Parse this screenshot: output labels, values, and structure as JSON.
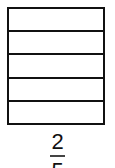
{
  "diagram": {
    "type": "fraction-bar-model",
    "orientation": "horizontal-stripes",
    "total_parts": 5,
    "sections": [
      {
        "index": 0,
        "shaded": false
      },
      {
        "index": 1,
        "shaded": false
      },
      {
        "index": 2,
        "shaded": false
      },
      {
        "index": 3,
        "shaded": false
      },
      {
        "index": 4,
        "shaded": false
      }
    ],
    "colors": {
      "stroke": "#111111",
      "fill": "#ffffff"
    }
  },
  "fraction": {
    "numerator": "2",
    "denominator": "5"
  }
}
